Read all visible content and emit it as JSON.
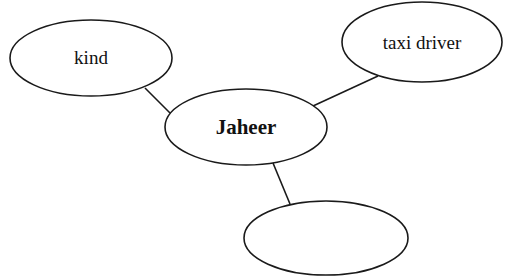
{
  "diagram": {
    "type": "mind-map",
    "center_node": {
      "label": "Jaheer",
      "cx": 246,
      "cy": 127,
      "rx": 81,
      "ry": 38
    },
    "nodes": [
      {
        "id": "kind",
        "label": "kind",
        "cx": 91,
        "cy": 58,
        "rx": 81,
        "ry": 38
      },
      {
        "id": "taxi-driver",
        "label": "taxi driver",
        "cx": 422,
        "cy": 42,
        "rx": 80,
        "ry": 40
      },
      {
        "id": "empty",
        "label": "",
        "cx": 326,
        "cy": 238,
        "rx": 82,
        "ry": 37
      }
    ],
    "edges": [
      {
        "from": "Jaheer",
        "to": "kind",
        "x1": 170,
        "y1": 113,
        "x2": 145,
        "y2": 88
      },
      {
        "from": "Jaheer",
        "to": "taxi-driver",
        "x1": 313,
        "y1": 106,
        "x2": 378,
        "y2": 76
      },
      {
        "from": "Jaheer",
        "to": "empty",
        "x1": 273,
        "y1": 163,
        "x2": 290,
        "y2": 204
      }
    ],
    "stroke_color": "#1a1a1a"
  }
}
